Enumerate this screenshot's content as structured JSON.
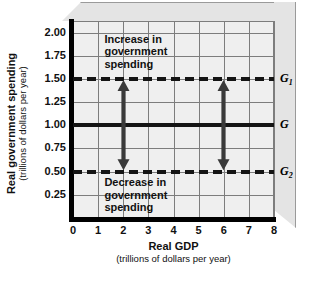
{
  "chart_data": {
    "type": "line",
    "title": "",
    "xlabel": "Real GDP",
    "xlabel_units": "(trillions of dollars per year)",
    "ylabel": "Real government spending",
    "ylabel_units": "(trillions of dollars per year)",
    "xlim": [
      0,
      8
    ],
    "ylim": [
      0,
      2.125
    ],
    "xticks": [
      "0",
      "1",
      "2",
      "3",
      "4",
      "5",
      "6",
      "7",
      "8"
    ],
    "yticks": [
      "2.00",
      "1.75",
      "1.50",
      "1.25",
      "1.00",
      "0.75",
      "0.50",
      "0.25"
    ],
    "ytick_values": [
      2.0,
      1.75,
      1.5,
      1.25,
      1.0,
      0.75,
      0.5,
      0.25
    ],
    "grid": true,
    "legend_position": "right-of-axes",
    "series": [
      {
        "name": "G1",
        "label": "G",
        "label_sub": "1",
        "style": "dashed",
        "value": 1.5,
        "x_from": 0,
        "x_to": 8,
        "color": "#141414"
      },
      {
        "name": "G",
        "label": "G",
        "label_sub": "",
        "style": "solid",
        "value": 1.0,
        "x_from": 0,
        "x_to": 8,
        "color": "#141414"
      },
      {
        "name": "G2",
        "label": "G",
        "label_sub": "2",
        "style": "dashed",
        "value": 0.5,
        "x_from": 0,
        "x_to": 8,
        "color": "#141414"
      }
    ],
    "annotations": [
      {
        "name": "increase-annotation",
        "text": "Increase in\ngovernment\nspending",
        "x": 1.25,
        "y_top": 2.0
      },
      {
        "name": "decrease-annotation",
        "text": "Decrease in\ngovernment\nspending",
        "x": 1.25,
        "y_top": 0.45
      }
    ],
    "arrows": [
      {
        "name": "increase-arrow-at-2",
        "x": 2,
        "y_from": 1.0,
        "y_to": 1.5,
        "direction": "up"
      },
      {
        "name": "decrease-arrow-at-2",
        "x": 2,
        "y_from": 1.0,
        "y_to": 0.5,
        "direction": "down"
      },
      {
        "name": "increase-arrow-at-6",
        "x": 6,
        "y_from": 1.0,
        "y_to": 1.5,
        "direction": "up"
      },
      {
        "name": "decrease-arrow-at-6",
        "x": 6,
        "y_from": 1.0,
        "y_to": 0.5,
        "direction": "down"
      }
    ],
    "colors": {
      "plot_background": "#efefef",
      "page_background": "#ffffff",
      "gridline": "#7d7d7d",
      "axis": "#000000",
      "line": "#141414",
      "bevel": "#e4e4e4"
    }
  }
}
